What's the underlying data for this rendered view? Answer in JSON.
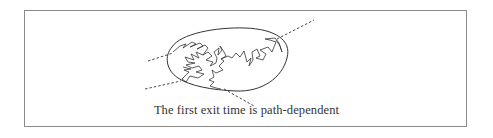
{
  "figure": {
    "caption": "The first exit time is path-dependent",
    "elements": {
      "domain": "ellipse",
      "path": "brownian-path",
      "exit_lines": [
        "upper-left",
        "lower-left",
        "upper-right",
        "bottom"
      ]
    },
    "colors": {
      "line": "#333333",
      "border": "#8a8a8a",
      "background": "#ffffff"
    }
  }
}
